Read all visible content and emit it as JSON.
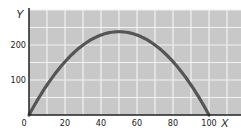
{
  "chart_data": {
    "type": "line",
    "title": "",
    "xlabel": "X",
    "ylabel": "Y",
    "xlim": [
      0,
      120
    ],
    "ylim": [
      0,
      300
    ],
    "x_ticks": [
      0,
      20,
      40,
      60,
      80,
      100
    ],
    "x_tick_labels": [
      "0",
      "20",
      "40",
      "60",
      "80",
      "100"
    ],
    "y_ticks": [
      100,
      200
    ],
    "y_tick_labels": [
      "100",
      "200"
    ],
    "grid": true,
    "grid_x_step": 10,
    "grid_y_step": 50,
    "legend": null,
    "series": [
      {
        "name": "trajectory",
        "x": [
          0,
          10,
          20,
          30,
          40,
          50,
          60,
          70,
          80,
          90,
          100
        ],
        "values": [
          0,
          86,
          152,
          200,
          229,
          238,
          229,
          200,
          152,
          86,
          0
        ]
      }
    ]
  },
  "colors": {
    "plot_background": "#c8c8c8",
    "grid": "#f2f2f2",
    "curve": "#555555",
    "axis": "#222222"
  }
}
